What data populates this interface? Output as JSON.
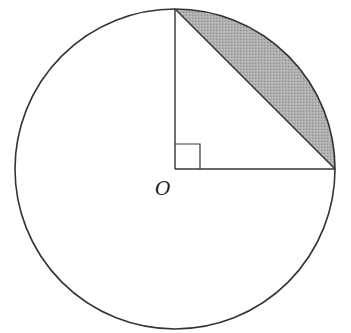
{
  "diagram": {
    "type": "geometry",
    "circle": {
      "cx": 175,
      "cy": 169,
      "r": 160,
      "stroke": "#333333"
    },
    "center_label": "O",
    "radius_top_end": {
      "x": 175,
      "y": 9
    },
    "radius_right_end": {
      "x": 335,
      "y": 169
    },
    "right_angle_marker_size": 25,
    "shaded_region": {
      "fill": "#a9a9a9",
      "description": "circular segment bounded by chord and minor arc"
    },
    "colors": {
      "line": "#333333",
      "shade": "#a9a9a9",
      "background": "#ffffff"
    }
  }
}
